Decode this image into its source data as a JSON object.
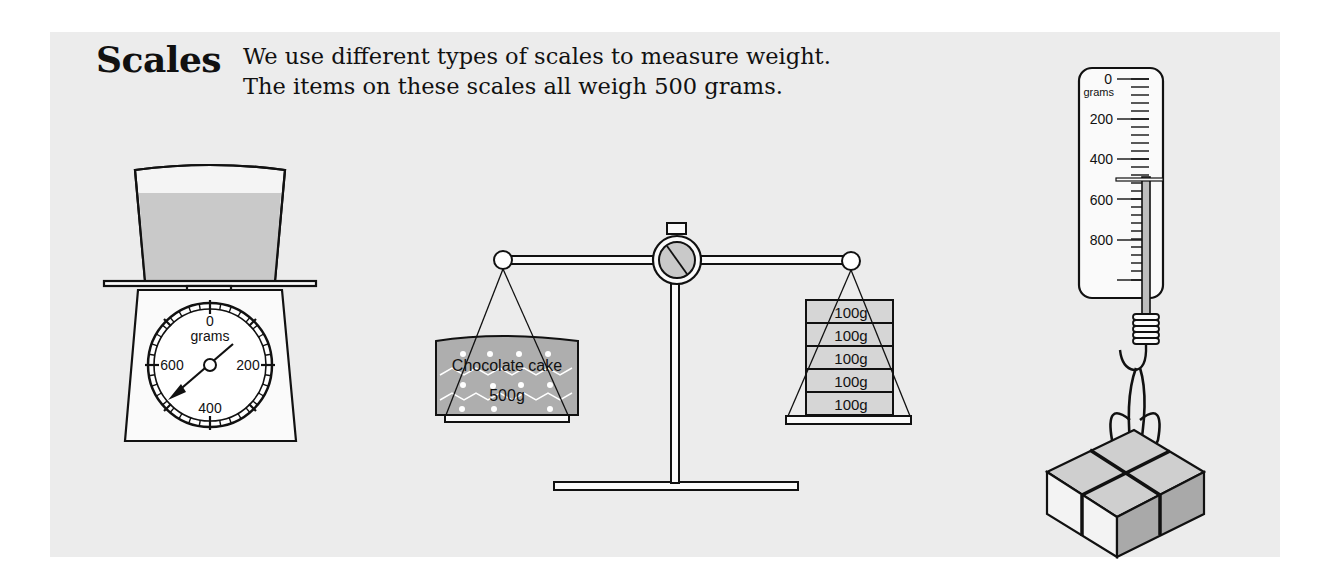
{
  "title": "Scales",
  "intro": {
    "line1": "We use different types of scales to measure weight.",
    "line2": "The items on these scales all weigh 500 grams."
  },
  "kitchen_scale": {
    "dial_unit": "grams",
    "dial_labels": [
      "0",
      "200",
      "400",
      "600"
    ],
    "reading_grams": 500
  },
  "balance_scale": {
    "left_item_line1": "Chocolate cake",
    "left_item_line2": "500g",
    "weights": [
      "100g",
      "100g",
      "100g",
      "100g",
      "100g"
    ]
  },
  "spring_scale": {
    "unit": "grams",
    "labels": [
      "0",
      "200",
      "400",
      "600",
      "800"
    ],
    "reading_grams": 500
  },
  "colors": {
    "panel": "#ececec",
    "fill_grey": "#c8c8c8",
    "light_grey": "#dcdcdc",
    "stroke": "#111111"
  }
}
